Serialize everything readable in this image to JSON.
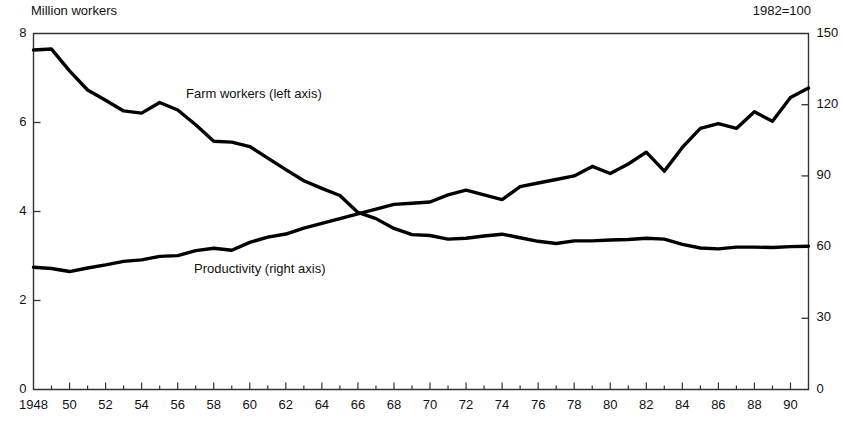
{
  "header": {
    "left_unit": "Million workers",
    "right_unit": "1982=100"
  },
  "series_labels": {
    "farm": "Farm workers (left axis)",
    "productivity": "Productivity (right axis)"
  },
  "axes": {
    "left_ticks": [
      "8",
      "6",
      "4",
      "2",
      "0"
    ],
    "right_ticks": [
      "150",
      "120",
      "90",
      "60",
      "30",
      "0"
    ],
    "x_ticks": [
      "1948",
      "50",
      "52",
      "54",
      "56",
      "58",
      "60",
      "62",
      "64",
      "66",
      "68",
      "70",
      "72",
      "74",
      "76",
      "78",
      "80",
      "82",
      "84",
      "86",
      "88",
      "90"
    ]
  },
  "style": {
    "line_color": "#000000",
    "frame_color": "#333333",
    "background": "#ffffff"
  },
  "chart_data": {
    "type": "line",
    "title": "",
    "subtitle": "",
    "xlabel": "",
    "ylabel": "Million workers",
    "y2label": "1982=100",
    "grid": false,
    "legend": "inline-annotations",
    "xlim": [
      1948,
      1991
    ],
    "ylim": [
      0,
      8
    ],
    "y2lim": [
      0,
      150
    ],
    "x_tick_step": 2,
    "x_minor_tick_step": 1,
    "x": [
      1948,
      1949,
      1950,
      1951,
      1952,
      1953,
      1954,
      1955,
      1956,
      1957,
      1958,
      1959,
      1960,
      1961,
      1962,
      1963,
      1964,
      1965,
      1966,
      1967,
      1968,
      1969,
      1970,
      1971,
      1972,
      1973,
      1974,
      1975,
      1976,
      1977,
      1978,
      1979,
      1980,
      1981,
      1982,
      1983,
      1984,
      1985,
      1986,
      1987,
      1988,
      1989,
      1990,
      1991
    ],
    "series": [
      {
        "name": "Farm workers (left axis)",
        "axis": "left",
        "units": "million workers",
        "values": [
          7.63,
          7.65,
          7.16,
          6.73,
          6.5,
          6.26,
          6.21,
          6.45,
          6.28,
          5.95,
          5.58,
          5.56,
          5.46,
          5.2,
          4.94,
          4.69,
          4.52,
          4.36,
          3.98,
          3.84,
          3.62,
          3.48,
          3.46,
          3.38,
          3.4,
          3.45,
          3.49,
          3.41,
          3.33,
          3.28,
          3.34,
          3.34,
          3.36,
          3.37,
          3.4,
          3.38,
          3.26,
          3.18,
          3.16,
          3.2,
          3.2,
          3.19,
          3.21,
          3.22
        ]
      },
      {
        "name": "Productivity (right axis)",
        "axis": "right",
        "units": "index, 1982=100",
        "values": [
          51.5,
          51.0,
          49.7,
          51.2,
          52.5,
          54.0,
          54.6,
          56.1,
          56.4,
          58.5,
          59.5,
          58.7,
          62.0,
          64.2,
          65.5,
          68.0,
          70.0,
          72.0,
          74.0,
          76.0,
          78.0,
          78.5,
          79.0,
          82.0,
          84.0,
          82.0,
          80.0,
          85.5,
          87.0,
          88.5,
          90.0,
          94.0,
          91.0,
          95.0,
          100.0,
          92.0,
          102.0,
          110.0,
          112.0,
          110.0,
          117.0,
          113.0,
          123.0,
          127.0
        ]
      }
    ]
  }
}
